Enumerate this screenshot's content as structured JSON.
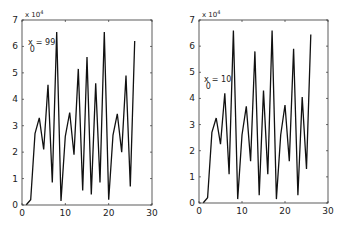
{
  "chart_data": [
    {
      "type": "line",
      "title": "",
      "xlabel": "",
      "ylabel": "",
      "y_multiplier_label": "x 10^4",
      "annotation": "x_0 = 99",
      "xlim": [
        0,
        30
      ],
      "ylim": [
        0,
        7
      ],
      "xticks": [
        0,
        10,
        20,
        30
      ],
      "yticks": [
        0,
        1,
        2,
        3,
        4,
        5,
        6,
        7
      ],
      "grid": false,
      "x": [
        1,
        2,
        3,
        4,
        5,
        6,
        7,
        8,
        9,
        10,
        11,
        12,
        13,
        14,
        15,
        16,
        17,
        18,
        19,
        20,
        21,
        22,
        23,
        24,
        25,
        26
      ],
      "values": [
        0.01,
        0.2,
        2.7,
        3.3,
        2.1,
        4.55,
        0.85,
        6.55,
        0.15,
        2.6,
        3.5,
        1.9,
        5.15,
        0.55,
        5.6,
        0.4,
        4.6,
        0.85,
        6.55,
        0.2,
        2.65,
        3.45,
        2.0,
        4.9,
        0.7,
        6.2
      ]
    },
    {
      "type": "line",
      "title": "",
      "xlabel": "",
      "ylabel": "",
      "y_multiplier_label": "x 10^4",
      "annotation": "x_0 = 10",
      "xlim": [
        0,
        30
      ],
      "ylim": [
        0,
        7
      ],
      "xticks": [
        0,
        10,
        20,
        30
      ],
      "yticks": [
        0,
        1,
        2,
        3,
        4,
        5,
        6,
        7
      ],
      "grid": false,
      "x": [
        1,
        2,
        3,
        4,
        5,
        6,
        7,
        8,
        9,
        10,
        11,
        12,
        13,
        14,
        15,
        16,
        17,
        18,
        19,
        20,
        21,
        22,
        23,
        24,
        25,
        26
      ],
      "values": [
        0.01,
        0.2,
        2.7,
        3.25,
        2.25,
        4.2,
        1.1,
        6.6,
        0.15,
        2.6,
        3.7,
        1.6,
        5.8,
        0.3,
        4.3,
        1.1,
        6.6,
        0.15,
        2.6,
        3.75,
        1.6,
        5.9,
        0.3,
        4.05,
        1.3,
        6.45
      ]
    }
  ],
  "labels": {
    "exp_base": "x 10",
    "exp_power": "4",
    "annot_left_main": "x",
    "annot_left_sub": "0",
    "annot_left_value": "= 99",
    "annot_right_main": "x",
    "annot_right_sub": "0",
    "annot_right_value": "= 10"
  }
}
